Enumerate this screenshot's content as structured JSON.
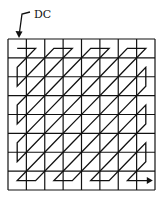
{
  "diagram": {
    "type": "jpeg-zigzag-scan",
    "label": "DC",
    "grid": {
      "rows": 8,
      "cols": 8,
      "left": 8,
      "top": 39,
      "width": 147,
      "height": 151
    },
    "colors": {
      "line": "#111111",
      "background": "#ffffff"
    },
    "path_order": [
      [
        0,
        0
      ],
      [
        0,
        1
      ],
      [
        1,
        0
      ],
      [
        2,
        0
      ],
      [
        1,
        1
      ],
      [
        0,
        2
      ],
      [
        0,
        3
      ],
      [
        1,
        2
      ],
      [
        2,
        1
      ],
      [
        3,
        0
      ],
      [
        4,
        0
      ],
      [
        3,
        1
      ],
      [
        2,
        2
      ],
      [
        1,
        3
      ],
      [
        0,
        4
      ],
      [
        0,
        5
      ],
      [
        1,
        4
      ],
      [
        2,
        3
      ],
      [
        3,
        2
      ],
      [
        4,
        1
      ],
      [
        5,
        0
      ],
      [
        6,
        0
      ],
      [
        5,
        1
      ],
      [
        4,
        2
      ],
      [
        3,
        3
      ],
      [
        2,
        4
      ],
      [
        1,
        5
      ],
      [
        0,
        6
      ],
      [
        0,
        7
      ],
      [
        1,
        6
      ],
      [
        2,
        5
      ],
      [
        3,
        4
      ],
      [
        4,
        3
      ],
      [
        5,
        2
      ],
      [
        6,
        1
      ],
      [
        7,
        0
      ],
      [
        7,
        1
      ],
      [
        6,
        2
      ],
      [
        5,
        3
      ],
      [
        4,
        4
      ],
      [
        3,
        5
      ],
      [
        2,
        6
      ],
      [
        1,
        7
      ],
      [
        2,
        7
      ],
      [
        3,
        6
      ],
      [
        4,
        5
      ],
      [
        5,
        4
      ],
      [
        6,
        3
      ],
      [
        7,
        2
      ],
      [
        7,
        3
      ],
      [
        6,
        4
      ],
      [
        5,
        5
      ],
      [
        4,
        6
      ],
      [
        3,
        7
      ],
      [
        4,
        7
      ],
      [
        5,
        6
      ],
      [
        6,
        5
      ],
      [
        7,
        4
      ],
      [
        7,
        5
      ],
      [
        6,
        6
      ],
      [
        5,
        7
      ],
      [
        6,
        7
      ],
      [
        7,
        6
      ],
      [
        7,
        7
      ]
    ]
  }
}
